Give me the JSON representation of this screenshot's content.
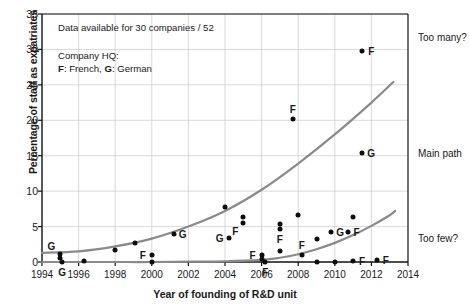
{
  "chart_data": {
    "type": "scatter",
    "title": "",
    "xlabel": "Year of founding of R&D unit",
    "ylabel": "Percentage of staff as expatriates",
    "xlim": [
      1994,
      2014
    ],
    "ylim": [
      0,
      35
    ],
    "xticks": [
      1994,
      1996,
      1998,
      2000,
      2002,
      2004,
      2006,
      2008,
      2010,
      2012,
      2014
    ],
    "yticks": [
      0,
      5,
      10,
      15,
      20,
      25,
      30,
      35
    ],
    "grid": true,
    "annotations": [
      "Data available for 30 companies / 52",
      "Company HQ:",
      "F: French, G: German"
    ],
    "legend_note_line1": "Data available for 30 companies / 52",
    "legend_note_line2": "Company HQ:",
    "legend_note_line3_a": "F",
    "legend_note_line3_b": ": French, ",
    "legend_note_line3_c": "G",
    "legend_note_line3_d": ": German",
    "right_labels": [
      "Too many?",
      "Main path",
      "Too few?"
    ],
    "point_marker_labels": [
      "F",
      "G"
    ],
    "points": [
      {
        "x": 1995.0,
        "y": 1.1,
        "label": "G",
        "label_pos": "above-left"
      },
      {
        "x": 1995.0,
        "y": 0.5,
        "label": "",
        "label_pos": ""
      },
      {
        "x": 1995.1,
        "y": 0.0,
        "label": "G",
        "label_pos": "below"
      },
      {
        "x": 1996.3,
        "y": 0.1,
        "label": "",
        "label_pos": ""
      },
      {
        "x": 1998.0,
        "y": 1.7,
        "label": "",
        "label_pos": ""
      },
      {
        "x": 1999.1,
        "y": 2.7,
        "label": "",
        "label_pos": ""
      },
      {
        "x": 2000.0,
        "y": 1.0,
        "label": "F",
        "label_pos": "left"
      },
      {
        "x": 2000.0,
        "y": 0.0,
        "label": "",
        "label_pos": ""
      },
      {
        "x": 2001.2,
        "y": 4.0,
        "label": "G",
        "label_pos": "right"
      },
      {
        "x": 2004.0,
        "y": 7.8,
        "label": "",
        "label_pos": ""
      },
      {
        "x": 2004.2,
        "y": 3.4,
        "label": "G",
        "label_pos": "left"
      },
      {
        "x": 2005.0,
        "y": 6.4,
        "label": "",
        "label_pos": ""
      },
      {
        "x": 2005.0,
        "y": 5.5,
        "label": "F",
        "label_pos": "below-left"
      },
      {
        "x": 2006.0,
        "y": 1.0,
        "label": "F",
        "label_pos": "left"
      },
      {
        "x": 2006.0,
        "y": 0.4,
        "label": "",
        "label_pos": ""
      },
      {
        "x": 2006.2,
        "y": 0.0,
        "label": "F",
        "label_pos": "below"
      },
      {
        "x": 2007.0,
        "y": 5.3,
        "label": "",
        "label_pos": ""
      },
      {
        "x": 2007.0,
        "y": 4.6,
        "label": "F",
        "label_pos": "below"
      },
      {
        "x": 2007.0,
        "y": 1.6,
        "label": "",
        "label_pos": ""
      },
      {
        "x": 2007.7,
        "y": 20.2,
        "label": "F",
        "label_pos": "above"
      },
      {
        "x": 2008.0,
        "y": 6.6,
        "label": "",
        "label_pos": ""
      },
      {
        "x": 2008.2,
        "y": 1.0,
        "label": "F",
        "label_pos": "above"
      },
      {
        "x": 2009.0,
        "y": 3.2,
        "label": "",
        "label_pos": ""
      },
      {
        "x": 2009.0,
        "y": 0.0,
        "label": "",
        "label_pos": ""
      },
      {
        "x": 2009.8,
        "y": 4.2,
        "label": "G",
        "label_pos": "right"
      },
      {
        "x": 2010.0,
        "y": 0.0,
        "label": "",
        "label_pos": ""
      },
      {
        "x": 2010.7,
        "y": 4.3,
        "label": "F",
        "label_pos": "right"
      },
      {
        "x": 2011.0,
        "y": 6.3,
        "label": "",
        "label_pos": ""
      },
      {
        "x": 2011.0,
        "y": 0.2,
        "label": "F",
        "label_pos": "right"
      },
      {
        "x": 2011.5,
        "y": 29.8,
        "label": "F",
        "label_pos": "right"
      },
      {
        "x": 2011.5,
        "y": 15.4,
        "label": "G",
        "label_pos": "right"
      },
      {
        "x": 2012.3,
        "y": 0.3,
        "label": "F",
        "label_pos": "right"
      }
    ],
    "curves": [
      {
        "name": "upper-band",
        "points": [
          [
            1994.0,
            1.3
          ],
          [
            1996.0,
            1.5
          ],
          [
            1998.0,
            2.2
          ],
          [
            2000.0,
            3.3
          ],
          [
            2002.0,
            5.0
          ],
          [
            2004.0,
            7.2
          ],
          [
            2006.0,
            10.2
          ],
          [
            2008.0,
            13.9
          ],
          [
            2010.0,
            18.0
          ],
          [
            2012.0,
            22.5
          ],
          [
            2013.2,
            25.4
          ]
        ]
      },
      {
        "name": "lower-band",
        "points": [
          [
            1994.0,
            0.0
          ],
          [
            1996.0,
            0.0
          ],
          [
            1998.0,
            0.0
          ],
          [
            2000.0,
            0.0
          ],
          [
            2002.0,
            0.05
          ],
          [
            2004.0,
            0.1
          ],
          [
            2006.0,
            0.3
          ],
          [
            2007.0,
            0.6
          ],
          [
            2008.0,
            1.1
          ],
          [
            2009.0,
            1.8
          ],
          [
            2010.0,
            2.7
          ],
          [
            2011.0,
            3.8
          ],
          [
            2012.0,
            5.1
          ],
          [
            2013.0,
            6.6
          ],
          [
            2013.3,
            7.2
          ]
        ]
      }
    ]
  },
  "geometry": {
    "plot_left": 42,
    "plot_right": 408,
    "plot_top": 14,
    "plot_bottom": 262
  }
}
